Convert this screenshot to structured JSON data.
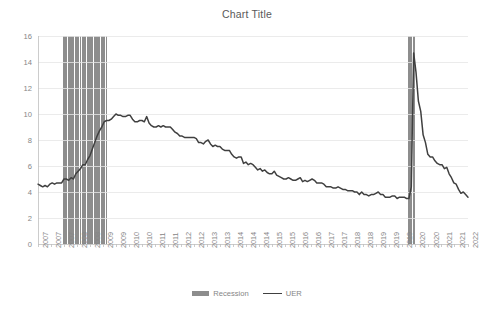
{
  "chart_data": {
    "type": "line",
    "title": "Chart Title",
    "xlabel": "",
    "ylabel": "",
    "ylim": [
      0,
      16
    ],
    "y_ticks": [
      0,
      2,
      4,
      6,
      8,
      10,
      12,
      14,
      16
    ],
    "grid": true,
    "legend_position": "bottom",
    "x_tick_labels": [
      "2007",
      "2007",
      "2007",
      "2008",
      "2008",
      "2009",
      "2009",
      "2010",
      "2010",
      "2011",
      "2011",
      "2012",
      "2012",
      "2013",
      "2013",
      "2014",
      "2014",
      "2014",
      "2015",
      "2015",
      "2016",
      "2016",
      "2017",
      "2017",
      "2018",
      "2018",
      "2019",
      "2019",
      "2019",
      "2020",
      "2020",
      "2021",
      "2021",
      "2022"
    ],
    "x_start": "2007-01",
    "x_end": "2022-03",
    "series": [
      {
        "name": "UER",
        "type": "line",
        "color": "#404040",
        "values": [
          4.6,
          4.5,
          4.4,
          4.5,
          4.4,
          4.6,
          4.7,
          4.6,
          4.7,
          4.7,
          4.7,
          5.0,
          5.0,
          4.9,
          5.1,
          5.0,
          5.4,
          5.6,
          5.8,
          6.1,
          6.1,
          6.5,
          6.8,
          7.3,
          7.8,
          8.3,
          8.7,
          9.0,
          9.4,
          9.5,
          9.5,
          9.6,
          9.8,
          10.0,
          9.9,
          9.9,
          9.8,
          9.8,
          9.9,
          9.9,
          9.6,
          9.4,
          9.4,
          9.5,
          9.5,
          9.4,
          9.8,
          9.3,
          9.1,
          9.0,
          9.0,
          9.1,
          9.0,
          9.1,
          9.0,
          9.0,
          9.0,
          8.8,
          8.6,
          8.5,
          8.3,
          8.3,
          8.2,
          8.2,
          8.2,
          8.2,
          8.2,
          8.1,
          7.8,
          7.8,
          7.7,
          7.9,
          8.0,
          7.7,
          7.5,
          7.6,
          7.5,
          7.5,
          7.3,
          7.2,
          7.2,
          7.2,
          6.9,
          6.7,
          6.6,
          6.7,
          6.7,
          6.2,
          6.3,
          6.1,
          6.2,
          6.1,
          5.9,
          5.7,
          5.8,
          5.6,
          5.7,
          5.5,
          5.4,
          5.4,
          5.6,
          5.3,
          5.2,
          5.1,
          5.0,
          5.0,
          5.1,
          5.0,
          4.9,
          4.9,
          5.0,
          5.1,
          4.8,
          4.9,
          4.8,
          4.9,
          5.0,
          4.9,
          4.7,
          4.7,
          4.7,
          4.6,
          4.4,
          4.4,
          4.4,
          4.3,
          4.3,
          4.4,
          4.3,
          4.2,
          4.2,
          4.1,
          4.1,
          4.1,
          4.0,
          4.0,
          3.8,
          4.0,
          3.8,
          3.8,
          3.7,
          3.8,
          3.8,
          3.9,
          4.0,
          3.8,
          3.8,
          3.6,
          3.6,
          3.6,
          3.7,
          3.7,
          3.5,
          3.6,
          3.6,
          3.6,
          3.5,
          3.5,
          4.4,
          14.7,
          13.2,
          11.0,
          10.2,
          8.4,
          7.8,
          6.9,
          6.7,
          6.7,
          6.4,
          6.2,
          6.1,
          6.1,
          5.8,
          5.9,
          5.4,
          5.1,
          4.7,
          4.6,
          4.2,
          3.9,
          4.0,
          3.8,
          3.6
        ]
      }
    ],
    "recession_bands": [
      {
        "name": "Recession",
        "start": "2007-12",
        "end": "2009-06",
        "color": "#8d8d8d"
      },
      {
        "name": "Recession",
        "start": "2020-02",
        "end": "2020-04",
        "color": "#8d8d8d"
      }
    ],
    "legend": [
      {
        "label": "Recession",
        "marker": "bar",
        "color": "#8d8d8d"
      },
      {
        "label": "UER",
        "marker": "line",
        "color": "#404040"
      }
    ],
    "axis": {
      "plot_left": 38,
      "plot_right": 468,
      "plot_top": 36,
      "plot_bottom": 244,
      "grid_color": "#e6e6e6",
      "axis_color": "#bfbfbf"
    }
  }
}
